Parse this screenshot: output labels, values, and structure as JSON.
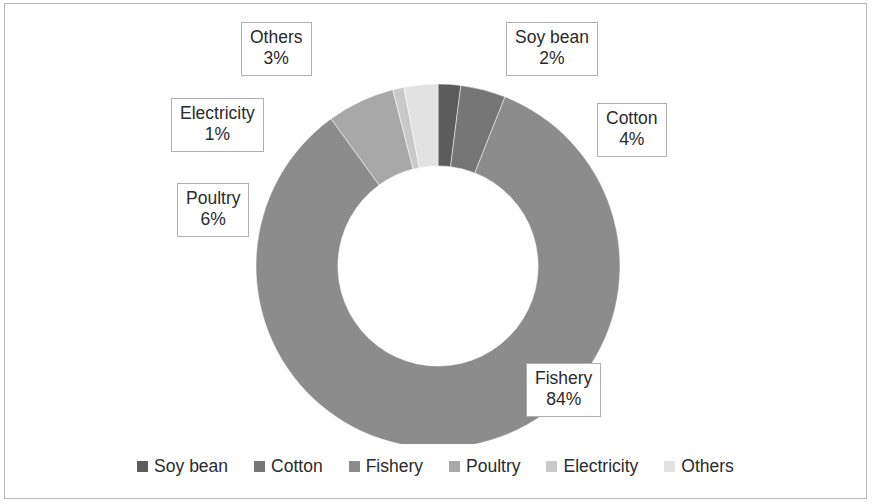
{
  "chart_data": {
    "type": "pie",
    "variant": "doughnut",
    "title": "",
    "subtitle": "",
    "xlabel": "",
    "ylabel": "",
    "grid": false,
    "legend_position": "bottom",
    "start_angle_deg": 0,
    "direction": "clockwise",
    "inner_radius_ratio": 0.55,
    "categories": [
      "Soy bean",
      "Cotton",
      "Fishery",
      "Poultry",
      "Electricity",
      "Others"
    ],
    "values": [
      2,
      4,
      84,
      6,
      1,
      3
    ],
    "value_unit": "%",
    "data_labels": [
      {
        "category": "Soy bean",
        "value": 2,
        "label_text": "Soy bean",
        "pct_text": "2%"
      },
      {
        "category": "Cotton",
        "value": 4,
        "label_text": "Cotton",
        "pct_text": "4%"
      },
      {
        "category": "Fishery",
        "value": 84,
        "label_text": "Fishery",
        "pct_text": "84%"
      },
      {
        "category": "Poultry",
        "value": 6,
        "label_text": "Poultry",
        "pct_text": "6%"
      },
      {
        "category": "Electricity",
        "value": 1,
        "label_text": "Electricity",
        "pct_text": "1%"
      },
      {
        "category": "Others",
        "value": 3,
        "label_text": "Others",
        "pct_text": "3%"
      }
    ],
    "colors": [
      "#5c5c5c",
      "#767676",
      "#8c8c8c",
      "#a8a8a8",
      "#c9c9c9",
      "#e2e2e2"
    ],
    "legend_entries": [
      {
        "label": "Soy bean",
        "color": "#5c5c5c"
      },
      {
        "label": "Cotton",
        "color": "#767676"
      },
      {
        "label": "Fishery",
        "color": "#8c8c8c"
      },
      {
        "label": "Poultry",
        "color": "#a8a8a8"
      },
      {
        "label": "Electricity",
        "color": "#c9c9c9"
      },
      {
        "label": "Others",
        "color": "#e2e2e2"
      }
    ]
  },
  "callouts": {
    "soy_bean": {
      "name": "Soy bean",
      "pct": "2%"
    },
    "cotton": {
      "name": "Cotton",
      "pct": "4%"
    },
    "fishery": {
      "name": "Fishery",
      "pct": "84%"
    },
    "poultry": {
      "name": "Poultry",
      "pct": "6%"
    },
    "electricity": {
      "name": "Electricity",
      "pct": "1%"
    },
    "others": {
      "name": "Others",
      "pct": "3%"
    }
  },
  "legend": {
    "items": [
      {
        "label": "Soy bean"
      },
      {
        "label": "Cotton"
      },
      {
        "label": "Fishery"
      },
      {
        "label": "Poultry"
      },
      {
        "label": "Electricity"
      },
      {
        "label": "Others"
      }
    ]
  }
}
